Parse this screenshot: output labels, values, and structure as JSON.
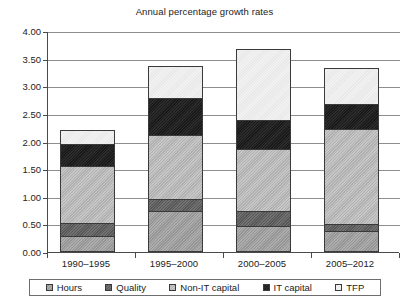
{
  "chart_data": {
    "type": "bar",
    "subtype": "stacked-bar",
    "title": "Annual percentage growth rates",
    "xlabel": "",
    "ylabel": "",
    "ylim": [
      0,
      4.0
    ],
    "ytick_values": [
      0.0,
      0.5,
      1.0,
      1.5,
      2.0,
      2.5,
      3.0,
      3.5,
      4.0
    ],
    "ytick_labels": [
      "0.00",
      "0.50",
      "1.00",
      "1.50",
      "2.00",
      "2.50",
      "3.00",
      "3.50",
      "4.00"
    ],
    "grid": "horizontal",
    "legend_position": "bottom",
    "categories": [
      "1990–1995",
      "1995–2000",
      "2000–2005",
      "2005–2012"
    ],
    "series": [
      {
        "name": "Hours",
        "color": "#9d9d9d",
        "values": [
          0.25,
          0.72,
          0.43,
          0.35
        ]
      },
      {
        "name": "Quality",
        "color": "#5e5e5e",
        "values": [
          0.25,
          0.22,
          0.28,
          0.13
        ]
      },
      {
        "name": "Non-IT capital",
        "color": "#b9b9b9",
        "values": [
          1.05,
          1.17,
          1.14,
          1.74
        ]
      },
      {
        "name": "IT capital",
        "color": "#1c1c1c",
        "values": [
          0.4,
          0.67,
          0.53,
          0.46
        ]
      },
      {
        "name": "TFP",
        "color": "#ededed",
        "values": [
          0.25,
          0.59,
          1.3,
          0.65
        ]
      }
    ],
    "totals": [
      2.2,
      3.37,
      3.68,
      3.33
    ]
  }
}
